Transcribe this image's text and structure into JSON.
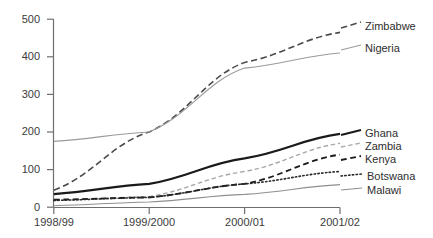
{
  "chart_data": {
    "type": "line",
    "title": "",
    "xlabel": "",
    "ylabel": "",
    "categories": [
      "1998/99",
      "1999/2000",
      "2000/01",
      "2001/02"
    ],
    "yticks": [
      0,
      100,
      200,
      300,
      400,
      500
    ],
    "ylim": [
      0,
      500
    ],
    "grid": false,
    "legend_position": "right-of-plot",
    "series": [
      {
        "name": "Zimbabwe",
        "values": [
          45,
          200,
          385,
          465
        ],
        "style": "long-dashed",
        "color": "#4a4a4a",
        "width": 1.6
      },
      {
        "name": "Nigeria",
        "values": [
          175,
          200,
          370,
          410
        ],
        "style": "solid",
        "color": "#9a9a9a",
        "width": 1.1
      },
      {
        "name": "Ghana",
        "values": [
          35,
          62,
          130,
          195
        ],
        "style": "solid",
        "color": "#1a1a1a",
        "width": 2.2
      },
      {
        "name": "Zambia",
        "values": [
          18,
          28,
          95,
          170
        ],
        "style": "dashed",
        "color": "#a8a8a8",
        "width": 1.4
      },
      {
        "name": "Kenya",
        "values": [
          20,
          26,
          62,
          140
        ],
        "style": "dashed",
        "color": "#1a1a1a",
        "width": 1.8
      },
      {
        "name": "Botswana",
        "values": [
          18,
          26,
          62,
          95
        ],
        "style": "dotted",
        "color": "#2a2a2a",
        "width": 1.6
      },
      {
        "name": "Malawi",
        "values": [
          4,
          14,
          34,
          60
        ],
        "style": "solid",
        "color": "#8f8f8f",
        "width": 1.1
      }
    ]
  },
  "axis": {
    "y_tick_labels": [
      "500",
      "400",
      "300",
      "200",
      "100",
      "0"
    ],
    "x_tick_labels": [
      "1998/99",
      "1999/2000",
      "2000/01",
      "2001/02"
    ]
  },
  "legend": {
    "entries": [
      {
        "label": "Zimbabwe"
      },
      {
        "label": "Nigeria"
      },
      {
        "label": "Ghana"
      },
      {
        "label": "Zambia"
      },
      {
        "label": "Kenya"
      },
      {
        "label": "Botswana"
      },
      {
        "label": "Malawi"
      }
    ]
  },
  "colors": {
    "axis": "#6e6e6e",
    "text": "#333333",
    "background": "#ffffff"
  }
}
